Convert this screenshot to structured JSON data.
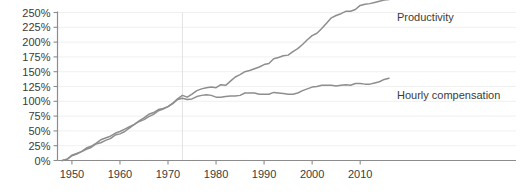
{
  "chart_data": {
    "type": "line",
    "title": "",
    "xlabel": "",
    "ylabel": "",
    "xlim": [
      1947,
      2016
    ],
    "ylim": [
      0,
      250
    ],
    "grid": true,
    "legend_position": "right-inline",
    "ytick_labels": [
      "0%",
      "25%",
      "50%",
      "75%",
      "100%",
      "125%",
      "150%",
      "175%",
      "200%",
      "225%",
      "250%"
    ],
    "ytick_values": [
      0,
      25,
      50,
      75,
      100,
      125,
      150,
      175,
      200,
      225,
      250
    ],
    "xtick_labels": [
      "1950",
      "1960",
      "1970",
      "1980",
      "1990",
      "2000",
      "2010"
    ],
    "xtick_values": [
      1950,
      1960,
      1970,
      1980,
      1990,
      2000,
      2010
    ],
    "annotations": [
      {
        "name": "divergence-marker",
        "type": "vertical-line",
        "x": 1973,
        "label": ""
      }
    ],
    "series": [
      {
        "name": "Productivity",
        "color": "#8e8e8e",
        "label_x": 2017,
        "label_y": 243,
        "x": [
          1948,
          1949,
          1950,
          1951,
          1952,
          1953,
          1954,
          1955,
          1956,
          1957,
          1958,
          1959,
          1960,
          1961,
          1962,
          1963,
          1964,
          1965,
          1966,
          1967,
          1968,
          1969,
          1970,
          1971,
          1972,
          1973,
          1974,
          1975,
          1976,
          1977,
          1978,
          1979,
          1980,
          1981,
          1982,
          1983,
          1984,
          1985,
          1986,
          1987,
          1988,
          1989,
          1990,
          1991,
          1992,
          1993,
          1994,
          1995,
          1996,
          1997,
          1998,
          1999,
          2000,
          2001,
          2002,
          2003,
          2004,
          2005,
          2006,
          2007,
          2008,
          2009,
          2010,
          2011,
          2012,
          2013,
          2014,
          2015,
          2016
        ],
        "values": [
          0,
          2,
          9,
          12,
          15,
          19,
          22,
          28,
          30,
          34,
          37,
          43,
          45,
          49,
          55,
          61,
          67,
          72,
          78,
          81,
          86,
          88,
          91,
          97,
          104,
          110,
          107,
          112,
          118,
          121,
          123,
          124,
          123,
          128,
          127,
          134,
          141,
          145,
          150,
          152,
          155,
          158,
          162,
          164,
          172,
          174,
          177,
          178,
          184,
          189,
          196,
          204,
          211,
          215,
          223,
          232,
          241,
          245,
          248,
          252,
          252,
          255,
          262,
          264,
          265,
          267,
          269,
          271,
          272
        ]
      },
      {
        "name": "Hourly compensation",
        "color": "#8e8e8e",
        "label_x": 2017,
        "label_y": 110,
        "x": [
          1948,
          1949,
          1950,
          1951,
          1952,
          1953,
          1954,
          1955,
          1956,
          1957,
          1958,
          1959,
          1960,
          1961,
          1962,
          1963,
          1964,
          1965,
          1966,
          1967,
          1968,
          1969,
          1970,
          1971,
          1972,
          1973,
          1974,
          1975,
          1976,
          1977,
          1978,
          1979,
          1980,
          1981,
          1982,
          1983,
          1984,
          1985,
          1986,
          1987,
          1988,
          1989,
          1990,
          1991,
          1992,
          1993,
          1994,
          1995,
          1996,
          1997,
          1998,
          1999,
          2000,
          2001,
          2002,
          2003,
          2004,
          2005,
          2006,
          2007,
          2008,
          2009,
          2010,
          2011,
          2012,
          2013,
          2014,
          2015,
          2016
        ],
        "values": [
          0,
          2,
          8,
          11,
          15,
          21,
          24,
          29,
          35,
          38,
          41,
          46,
          49,
          53,
          57,
          61,
          66,
          69,
          74,
          78,
          84,
          87,
          91,
          96,
          103,
          105,
          103,
          104,
          108,
          110,
          111,
          110,
          107,
          107,
          108,
          109,
          109,
          110,
          114,
          114,
          114,
          112,
          112,
          112,
          115,
          114,
          113,
          112,
          112,
          114,
          118,
          121,
          124,
          125,
          127,
          127,
          127,
          126,
          127,
          128,
          127,
          130,
          130,
          129,
          129,
          131,
          133,
          137,
          139
        ]
      }
    ]
  },
  "axis": {
    "y_axis_name": "percent-axis",
    "x_axis_name": "year-axis"
  }
}
